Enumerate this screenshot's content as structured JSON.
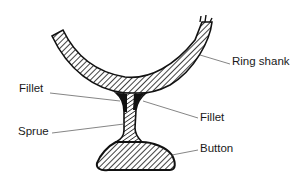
{
  "diagram": {
    "colors": {
      "ink": "#111111",
      "leader": "#666666",
      "background": "#ffffff"
    },
    "labels": {
      "ring_shank": "Ring shank",
      "fillet_left": "Fillet",
      "fillet_right": "Fillet",
      "sprue": "Sprue",
      "button": "Button"
    },
    "parts": [
      {
        "id": "ring-shank",
        "label": "Ring shank"
      },
      {
        "id": "fillet-left",
        "label": "Fillet"
      },
      {
        "id": "fillet-right",
        "label": "Fillet"
      },
      {
        "id": "sprue",
        "label": "Sprue"
      },
      {
        "id": "button",
        "label": "Button"
      }
    ]
  }
}
